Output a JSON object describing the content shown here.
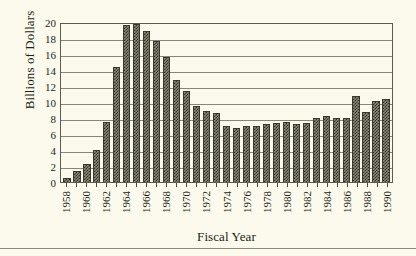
{
  "chart_data": {
    "type": "bar",
    "title": "",
    "xlabel": "Fiscal Year",
    "ylabel": "Billions of Dollars",
    "ylim": [
      0,
      20
    ],
    "ytick_values": [
      20,
      18,
      16,
      14,
      12,
      10,
      8,
      6,
      4,
      2,
      0
    ],
    "ytick_labels": [
      "20",
      "18",
      "16",
      "14",
      "12",
      "10",
      "8",
      "6",
      "4",
      "2",
      "0"
    ],
    "grid": "horizontal",
    "legend": "none",
    "xtick_label_interval": 2,
    "categories": [
      "1958",
      "1959",
      "1960",
      "1961",
      "1962",
      "1963",
      "1964",
      "1965",
      "1966",
      "1967",
      "1968",
      "1969",
      "1970",
      "1971",
      "1972",
      "1973",
      "1974",
      "1975",
      "1976",
      "1977",
      "1978",
      "1979",
      "1980",
      "1981",
      "1982",
      "1983",
      "1984",
      "1985",
      "1986",
      "1987",
      "1988",
      "1989",
      "1990"
    ],
    "visible_xtick_labels": [
      "1958",
      "",
      "1960",
      "",
      "1962",
      "",
      "1964",
      "",
      "1966",
      "",
      "1968",
      "",
      "1970",
      "",
      "1972",
      "",
      "1974",
      "",
      "1976",
      "",
      "1978",
      "",
      "1980",
      "",
      "1982",
      "",
      "1984",
      "",
      "1986",
      "",
      "1988",
      "",
      "1990"
    ],
    "values": [
      0.5,
      1.4,
      2.2,
      4.0,
      7.5,
      14.4,
      19.6,
      19.7,
      18.9,
      17.6,
      15.6,
      12.8,
      11.4,
      9.5,
      8.9,
      8.6,
      7.0,
      6.8,
      7.0,
      7.0,
      7.2,
      7.35,
      7.55,
      7.25,
      7.4,
      8.05,
      8.25,
      8.0,
      8.0,
      10.8,
      8.8,
      10.1,
      10.4
    ],
    "bar_fill": "checkered-gray-dither",
    "colors": {
      "background": "#fbfaec",
      "bar": "#2e2d24",
      "axis": "#5c5b4e",
      "grid": "#86857a",
      "text": "#211f18"
    }
  }
}
